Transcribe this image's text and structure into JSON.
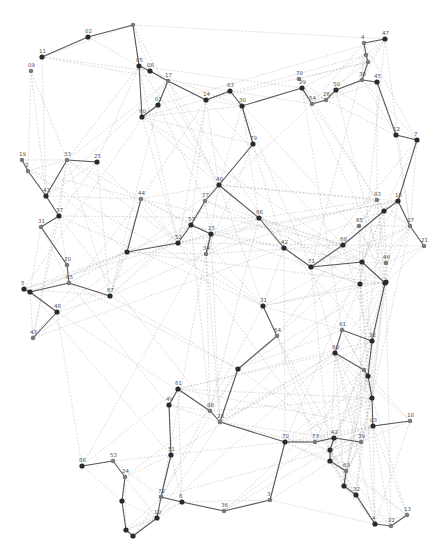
{
  "diagram": {
    "type": "network-graph",
    "colors": {
      "background": "#ffffff",
      "light_edge": "#b4b4b4",
      "dark_edge": "#3c3c3c",
      "dark_node": "#2a2a2a",
      "grey_node": "#7a7a7a",
      "label": "#555555"
    },
    "nodes": [
      {
        "id": "n02",
        "label": "02",
        "x": 88,
        "y": 37,
        "tone": "dark"
      },
      {
        "id": "n_top",
        "label": "",
        "x": 133,
        "y": 25,
        "tone": "grey"
      },
      {
        "id": "n11",
        "label": "11",
        "x": 42,
        "y": 57,
        "tone": "dark"
      },
      {
        "id": "n09",
        "label": "09",
        "x": 31,
        "y": 71,
        "tone": "grey"
      },
      {
        "id": "n05",
        "label": "05",
        "x": 139,
        "y": 66,
        "tone": "dark"
      },
      {
        "id": "n08",
        "label": "08",
        "x": 150,
        "y": 71,
        "tone": "dark"
      },
      {
        "id": "n17",
        "label": "17",
        "x": 168,
        "y": 81,
        "tone": "grey"
      },
      {
        "id": "n01",
        "label": "01",
        "x": 158,
        "y": 105,
        "tone": "dark"
      },
      {
        "id": "n60",
        "label": "60",
        "x": 142,
        "y": 117,
        "tone": "dark"
      },
      {
        "id": "n14",
        "label": "14",
        "x": 206,
        "y": 100,
        "tone": "dark"
      },
      {
        "id": "n63",
        "label": "63",
        "x": 230,
        "y": 91,
        "tone": "dark"
      },
      {
        "id": "n30",
        "label": "30",
        "x": 242,
        "y": 106,
        "tone": "dark"
      },
      {
        "id": "n70",
        "label": "70",
        "x": 299,
        "y": 79,
        "tone": "grey"
      },
      {
        "id": "n29",
        "label": "29",
        "x": 302,
        "y": 88,
        "tone": "dark"
      },
      {
        "id": "n54",
        "label": "54",
        "x": 312,
        "y": 104,
        "tone": "grey"
      },
      {
        "id": "n26",
        "label": "26",
        "x": 326,
        "y": 100,
        "tone": "grey"
      },
      {
        "id": "n50",
        "label": "50",
        "x": 336,
        "y": 90,
        "tone": "dark"
      },
      {
        "id": "n4",
        "label": "4",
        "x": 364,
        "y": 43,
        "tone": "grey"
      },
      {
        "id": "n47",
        "label": "47",
        "x": 385,
        "y": 39,
        "tone": "dark"
      },
      {
        "id": "n_r1",
        "label": "",
        "x": 366,
        "y": 55,
        "tone": "grey"
      },
      {
        "id": "n_r2",
        "label": "",
        "x": 368,
        "y": 62,
        "tone": "grey"
      },
      {
        "id": "n36",
        "label": "36",
        "x": 362,
        "y": 80,
        "tone": "grey"
      },
      {
        "id": "n45",
        "label": "45",
        "x": 377,
        "y": 82,
        "tone": "dark"
      },
      {
        "id": "n12",
        "label": "12",
        "x": 396,
        "y": 135,
        "tone": "dark"
      },
      {
        "id": "n7",
        "label": "7",
        "x": 417,
        "y": 140,
        "tone": "dark"
      },
      {
        "id": "n79",
        "label": "79",
        "x": 253,
        "y": 144,
        "tone": "dark"
      },
      {
        "id": "n19",
        "label": "19",
        "x": 22,
        "y": 160,
        "tone": "grey"
      },
      {
        "id": "n2",
        "label": "2",
        "x": 28,
        "y": 171,
        "tone": "grey"
      },
      {
        "id": "n33",
        "label": "33",
        "x": 67,
        "y": 160,
        "tone": "grey"
      },
      {
        "id": "n25",
        "label": "25",
        "x": 97,
        "y": 162,
        "tone": "dark"
      },
      {
        "id": "n43",
        "label": "43",
        "x": 46,
        "y": 196,
        "tone": "dark"
      },
      {
        "id": "n44",
        "label": "44",
        "x": 141,
        "y": 199,
        "tone": "grey"
      },
      {
        "id": "n40",
        "label": "40",
        "x": 219,
        "y": 185,
        "tone": "dark"
      },
      {
        "id": "n77",
        "label": "77",
        "x": 205,
        "y": 201,
        "tone": "grey"
      },
      {
        "id": "n37",
        "label": "37",
        "x": 59,
        "y": 216,
        "tone": "dark"
      },
      {
        "id": "n31",
        "label": "31",
        "x": 41,
        "y": 227,
        "tone": "grey"
      },
      {
        "id": "n57",
        "label": "57",
        "x": 191,
        "y": 225,
        "tone": "dark"
      },
      {
        "id": "n15",
        "label": "15",
        "x": 211,
        "y": 234,
        "tone": "dark"
      },
      {
        "id": "n52",
        "label": "52",
        "x": 178,
        "y": 243,
        "tone": "dark"
      },
      {
        "id": "n34",
        "label": "34",
        "x": 206,
        "y": 254,
        "tone": "grey"
      },
      {
        "id": "n_c1",
        "label": "",
        "x": 127,
        "y": 252,
        "tone": "dark"
      },
      {
        "id": "n66",
        "label": "66",
        "x": 259,
        "y": 218,
        "tone": "dark"
      },
      {
        "id": "n42",
        "label": "42",
        "x": 284,
        "y": 248,
        "tone": "dark"
      },
      {
        "id": "n71",
        "label": "71",
        "x": 311,
        "y": 267,
        "tone": "dark"
      },
      {
        "id": "n68",
        "label": "68",
        "x": 343,
        "y": 245,
        "tone": "dark"
      },
      {
        "id": "n65",
        "label": "65",
        "x": 359,
        "y": 226,
        "tone": "grey"
      },
      {
        "id": "n83",
        "label": "83",
        "x": 377,
        "y": 200,
        "tone": "grey"
      },
      {
        "id": "n_m1",
        "label": "",
        "x": 384,
        "y": 211,
        "tone": "grey"
      },
      {
        "id": "n16",
        "label": "16",
        "x": 398,
        "y": 201,
        "tone": "dark"
      },
      {
        "id": "n_m2",
        "label": "",
        "x": 384,
        "y": 211,
        "tone": "dark"
      },
      {
        "id": "n27",
        "label": "27",
        "x": 410,
        "y": 226,
        "tone": "grey"
      },
      {
        "id": "n21",
        "label": "21",
        "x": 424,
        "y": 246,
        "tone": "grey"
      },
      {
        "id": "n46",
        "label": "46",
        "x": 386,
        "y": 263,
        "tone": "grey"
      },
      {
        "id": "n_m3",
        "label": "",
        "x": 386,
        "y": 282,
        "tone": "dark"
      },
      {
        "id": "n_m4",
        "label": "",
        "x": 360,
        "y": 284,
        "tone": "dark"
      },
      {
        "id": "n20",
        "label": "20",
        "x": 67,
        "y": 265,
        "tone": "grey"
      },
      {
        "id": "n85",
        "label": "85",
        "x": 69,
        "y": 283,
        "tone": "grey"
      },
      {
        "id": "n5x",
        "label": "5",
        "x": 24,
        "y": 289,
        "tone": "dark"
      },
      {
        "id": "n_l1",
        "label": "",
        "x": 30,
        "y": 292,
        "tone": "dark"
      },
      {
        "id": "n48",
        "label": "48",
        "x": 57,
        "y": 312,
        "tone": "dark"
      },
      {
        "id": "n43b",
        "label": "43",
        "x": 33,
        "y": 338,
        "tone": "grey"
      },
      {
        "id": "n67",
        "label": "67",
        "x": 110,
        "y": 296,
        "tone": "dark"
      },
      {
        "id": "n31b",
        "label": "31",
        "x": 263,
        "y": 306,
        "tone": "dark"
      },
      {
        "id": "n_c2",
        "label": "",
        "x": 362,
        "y": 262,
        "tone": "dark"
      },
      {
        "id": "n_c3",
        "label": "",
        "x": 385,
        "y": 283,
        "tone": "dark"
      },
      {
        "id": "n64",
        "label": "64",
        "x": 277,
        "y": 336,
        "tone": "grey"
      },
      {
        "id": "n81",
        "label": "81",
        "x": 342,
        "y": 330,
        "tone": "grey"
      },
      {
        "id": "n80",
        "label": "80",
        "x": 335,
        "y": 353,
        "tone": "dark"
      },
      {
        "id": "n32",
        "label": "32",
        "x": 372,
        "y": 341,
        "tone": "dark"
      },
      {
        "id": "n_c4",
        "label": "",
        "x": 364,
        "y": 370,
        "tone": "grey"
      },
      {
        "id": "n_c5",
        "label": "",
        "x": 368,
        "y": 376,
        "tone": "dark"
      },
      {
        "id": "n_c6",
        "label": "",
        "x": 238,
        "y": 369,
        "tone": "dark"
      },
      {
        "id": "n61",
        "label": "61",
        "x": 178,
        "y": 389,
        "tone": "dark"
      },
      {
        "id": "n49",
        "label": "49",
        "x": 169,
        "y": 405,
        "tone": "dark"
      },
      {
        "id": "n88",
        "label": "88",
        "x": 210,
        "y": 411,
        "tone": "grey"
      },
      {
        "id": "n28",
        "label": "28",
        "x": 220,
        "y": 422,
        "tone": "grey"
      },
      {
        "id": "n_b_top",
        "label": "",
        "x": 372,
        "y": 398,
        "tone": "dark"
      },
      {
        "id": "n18",
        "label": "18",
        "x": 410,
        "y": 421,
        "tone": "grey"
      },
      {
        "id": "n03",
        "label": "03",
        "x": 373,
        "y": 426,
        "tone": "dark"
      },
      {
        "id": "n70b",
        "label": "70",
        "x": 285,
        "y": 442,
        "tone": "dark"
      },
      {
        "id": "n73",
        "label": "73",
        "x": 315,
        "y": 442,
        "tone": "grey"
      },
      {
        "id": "n42b",
        "label": "42",
        "x": 334,
        "y": 438,
        "tone": "dark"
      },
      {
        "id": "n39",
        "label": "39",
        "x": 361,
        "y": 442,
        "tone": "grey"
      },
      {
        "id": "n_b1",
        "label": "",
        "x": 330,
        "y": 450,
        "tone": "dark"
      },
      {
        "id": "n_b2",
        "label": "",
        "x": 330,
        "y": 461,
        "tone": "dark"
      },
      {
        "id": "n63b",
        "label": "63",
        "x": 346,
        "y": 471,
        "tone": "grey"
      },
      {
        "id": "n_b3",
        "label": "",
        "x": 344,
        "y": 486,
        "tone": "dark"
      },
      {
        "id": "n32b",
        "label": "32",
        "x": 356,
        "y": 495,
        "tone": "dark"
      },
      {
        "id": "n86",
        "label": "86",
        "x": 82,
        "y": 466,
        "tone": "dark"
      },
      {
        "id": "n53",
        "label": "53",
        "x": 113,
        "y": 461,
        "tone": "grey"
      },
      {
        "id": "n51",
        "label": "51",
        "x": 171,
        "y": 455,
        "tone": "dark"
      },
      {
        "id": "n24",
        "label": "24",
        "x": 125,
        "y": 477,
        "tone": "grey"
      },
      {
        "id": "n_b4",
        "label": "",
        "x": 122,
        "y": 501,
        "tone": "dark"
      },
      {
        "id": "n72",
        "label": "72",
        "x": 161,
        "y": 497,
        "tone": "grey"
      },
      {
        "id": "n6",
        "label": "6",
        "x": 182,
        "y": 502,
        "tone": "dark"
      },
      {
        "id": "n36b",
        "label": "36",
        "x": 224,
        "y": 511,
        "tone": "grey"
      },
      {
        "id": "n3",
        "label": "3",
        "x": 270,
        "y": 500,
        "tone": "grey"
      },
      {
        "id": "n10",
        "label": "10",
        "x": 157,
        "y": 518,
        "tone": "dark"
      },
      {
        "id": "n_b5",
        "label": "",
        "x": 126,
        "y": 530,
        "tone": "dark"
      },
      {
        "id": "n_b6",
        "label": "",
        "x": 133,
        "y": 536,
        "tone": "dark"
      },
      {
        "id": "n4b",
        "label": "4",
        "x": 375,
        "y": 524,
        "tone": "dark"
      },
      {
        "id": "n22",
        "label": "22",
        "x": 391,
        "y": 526,
        "tone": "grey"
      },
      {
        "id": "n13",
        "label": "13",
        "x": 407,
        "y": 515,
        "tone": "grey"
      }
    ],
    "dark_edges": [
      [
        "n11",
        "n02"
      ],
      [
        "n02",
        "n_top"
      ],
      [
        "n_top",
        "n05"
      ],
      [
        "n05",
        "n08"
      ],
      [
        "n08",
        "n17"
      ],
      [
        "n17",
        "n01"
      ],
      [
        "n01",
        "n60"
      ],
      [
        "n05",
        "n60"
      ],
      [
        "n17",
        "n14"
      ],
      [
        "n14",
        "n63"
      ],
      [
        "n63",
        "n30"
      ],
      [
        "n30",
        "n29"
      ],
      [
        "n29",
        "n54"
      ],
      [
        "n54",
        "n26"
      ],
      [
        "n26",
        "n50"
      ],
      [
        "n50",
        "n36"
      ],
      [
        "n36",
        "n45"
      ],
      [
        "n4",
        "n47"
      ],
      [
        "n4",
        "n_r1"
      ],
      [
        "n_r1",
        "n_r2"
      ],
      [
        "n_r2",
        "n36"
      ],
      [
        "n45",
        "n12"
      ],
      [
        "n12",
        "n7"
      ],
      [
        "n30",
        "n79"
      ],
      [
        "n79",
        "n40"
      ],
      [
        "n40",
        "n77"
      ],
      [
        "n77",
        "n57"
      ],
      [
        "n57",
        "n15"
      ],
      [
        "n15",
        "n34"
      ],
      [
        "n57",
        "n52"
      ],
      [
        "n52",
        "n_c1"
      ],
      [
        "n_c1",
        "n44"
      ],
      [
        "n40",
        "n66"
      ],
      [
        "n66",
        "n42"
      ],
      [
        "n42",
        "n71"
      ],
      [
        "n71",
        "n68"
      ],
      [
        "n68",
        "n_m1"
      ],
      [
        "n_m1",
        "n16"
      ],
      [
        "n16",
        "n7"
      ],
      [
        "n16",
        "n27"
      ],
      [
        "n27",
        "n21"
      ],
      [
        "n19",
        "n2"
      ],
      [
        "n2",
        "n43"
      ],
      [
        "n33",
        "n25"
      ],
      [
        "n33",
        "n43"
      ],
      [
        "n43",
        "n37"
      ],
      [
        "n37",
        "n31"
      ],
      [
        "n31",
        "n20"
      ],
      [
        "n20",
        "n85"
      ],
      [
        "n85",
        "n67"
      ],
      [
        "n5x",
        "n_l1"
      ],
      [
        "n_l1",
        "n48"
      ],
      [
        "n48",
        "n43b"
      ],
      [
        "n_l1",
        "n85"
      ],
      [
        "n71",
        "n_c2"
      ],
      [
        "n_c2",
        "n_c3"
      ],
      [
        "n_c3",
        "n32"
      ],
      [
        "n31b",
        "n64"
      ],
      [
        "n64",
        "n_c6"
      ],
      [
        "n81",
        "n80"
      ],
      [
        "n81",
        "n32"
      ],
      [
        "n80",
        "n_c4"
      ],
      [
        "n_c4",
        "n_c5"
      ],
      [
        "n32",
        "n_c5"
      ],
      [
        "n_c5",
        "n_b_top"
      ],
      [
        "n_b_top",
        "n03"
      ],
      [
        "n03",
        "n18"
      ],
      [
        "n61",
        "n49"
      ],
      [
        "n61",
        "n88"
      ],
      [
        "n88",
        "n28"
      ],
      [
        "n_c6",
        "n28"
      ],
      [
        "n70b",
        "n73"
      ],
      [
        "n73",
        "n42b"
      ],
      [
        "n42b",
        "n39"
      ],
      [
        "n42b",
        "n_b1"
      ],
      [
        "n_b1",
        "n_b2"
      ],
      [
        "n_b2",
        "n63b"
      ],
      [
        "n63b",
        "n_b3"
      ],
      [
        "n_b3",
        "n32b"
      ],
      [
        "n32b",
        "n4b"
      ],
      [
        "n4b",
        "n22"
      ],
      [
        "n22",
        "n13"
      ],
      [
        "n49",
        "n51"
      ],
      [
        "n51",
        "n72"
      ],
      [
        "n72",
        "n10"
      ],
      [
        "n86",
        "n53"
      ],
      [
        "n53",
        "n24"
      ],
      [
        "n24",
        "n_b4"
      ],
      [
        "n_b4",
        "n_b5"
      ],
      [
        "n_b5",
        "n_b6"
      ],
      [
        "n_b6",
        "n10"
      ],
      [
        "n72",
        "n6"
      ],
      [
        "n6",
        "n36b"
      ],
      [
        "n36b",
        "n3"
      ],
      [
        "n3",
        "n70b"
      ],
      [
        "n70b",
        "n28"
      ]
    ]
  }
}
